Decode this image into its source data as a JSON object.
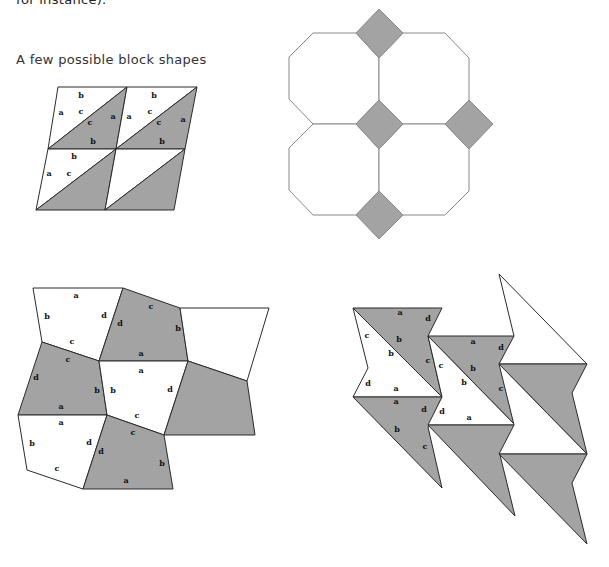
{
  "page": {
    "top_clipped_text": "for instance).",
    "heading": "A few possible block shapes"
  },
  "colors": {
    "fill_shaded": "#a3a3a3",
    "fill_light": "#ffffff",
    "stroke_dark": "#2a2a2a",
    "stroke_light": "#8a8a8a"
  },
  "figures": [
    {
      "name": "parallelogram-triangles",
      "description": "2x2 parallelogram blocks each split diagonally into white and shaded triangles",
      "labels": [
        {
          "t": "b",
          "x": 81,
          "y": 96
        },
        {
          "t": "a",
          "x": 61,
          "y": 113
        },
        {
          "t": "c",
          "x": 81,
          "y": 112
        },
        {
          "t": "c",
          "x": 90,
          "y": 123
        },
        {
          "t": "a",
          "x": 113,
          "y": 117
        },
        {
          "t": "b",
          "x": 93,
          "y": 142
        },
        {
          "t": "b",
          "x": 154,
          "y": 96
        },
        {
          "t": "a",
          "x": 129,
          "y": 117
        },
        {
          "t": "c",
          "x": 150,
          "y": 112
        },
        {
          "t": "c",
          "x": 159,
          "y": 123
        },
        {
          "t": "a",
          "x": 183,
          "y": 120
        },
        {
          "t": "b",
          "x": 162,
          "y": 142
        },
        {
          "t": "b",
          "x": 74,
          "y": 157
        },
        {
          "t": "a",
          "x": 49,
          "y": 174
        },
        {
          "t": "c",
          "x": 69,
          "y": 174
        }
      ]
    },
    {
      "name": "octagon-square",
      "description": "Four octagons with shaded square diamonds at the junctions",
      "labels": []
    },
    {
      "name": "quadrilateral-pentagons",
      "description": "Irregular quadrilaterals alternating white and shaded",
      "labels": [
        {
          "t": "a",
          "x": 76,
          "y": 296
        },
        {
          "t": "b",
          "x": 47,
          "y": 317
        },
        {
          "t": "d",
          "x": 104,
          "y": 316
        },
        {
          "t": "c",
          "x": 72,
          "y": 342
        },
        {
          "t": "c",
          "x": 151,
          "y": 307
        },
        {
          "t": "d",
          "x": 120,
          "y": 324
        },
        {
          "t": "b",
          "x": 178,
          "y": 329
        },
        {
          "t": "a",
          "x": 141,
          "y": 354
        },
        {
          "t": "c",
          "x": 68,
          "y": 360
        },
        {
          "t": "d",
          "x": 36,
          "y": 378
        },
        {
          "t": "b",
          "x": 97,
          "y": 391
        },
        {
          "t": "a",
          "x": 61,
          "y": 407
        },
        {
          "t": "a",
          "x": 141,
          "y": 371
        },
        {
          "t": "b",
          "x": 113,
          "y": 391
        },
        {
          "t": "d",
          "x": 170,
          "y": 390
        },
        {
          "t": "c",
          "x": 137,
          "y": 416
        },
        {
          "t": "a",
          "x": 61,
          "y": 423
        },
        {
          "t": "b",
          "x": 32,
          "y": 444
        },
        {
          "t": "d",
          "x": 89,
          "y": 443
        },
        {
          "t": "c",
          "x": 57,
          "y": 469
        },
        {
          "t": "c",
          "x": 133,
          "y": 433
        },
        {
          "t": "d",
          "x": 101,
          "y": 452
        },
        {
          "t": "b",
          "x": 162,
          "y": 464
        },
        {
          "t": "a",
          "x": 126,
          "y": 481
        }
      ]
    },
    {
      "name": "lightning-bolts",
      "description": "Notched triangles forming lightning-bolt tessellation",
      "labels": [
        {
          "t": "a",
          "x": 400,
          "y": 313
        },
        {
          "t": "d",
          "x": 428,
          "y": 319
        },
        {
          "t": "c",
          "x": 367,
          "y": 336
        },
        {
          "t": "b",
          "x": 399,
          "y": 340
        },
        {
          "t": "b",
          "x": 391,
          "y": 354
        },
        {
          "t": "c",
          "x": 428,
          "y": 361
        },
        {
          "t": "d",
          "x": 368,
          "y": 384
        },
        {
          "t": "a",
          "x": 396,
          "y": 389
        },
        {
          "t": "a",
          "x": 396,
          "y": 402
        },
        {
          "t": "d",
          "x": 424,
          "y": 410
        },
        {
          "t": "b",
          "x": 397,
          "y": 430
        },
        {
          "t": "c",
          "x": 425,
          "y": 447
        },
        {
          "t": "d",
          "x": 442,
          "y": 412
        },
        {
          "t": "a",
          "x": 473,
          "y": 342
        },
        {
          "t": "d",
          "x": 501,
          "y": 348
        },
        {
          "t": "c",
          "x": 441,
          "y": 366
        },
        {
          "t": "b",
          "x": 473,
          "y": 369
        },
        {
          "t": "b",
          "x": 464,
          "y": 383
        },
        {
          "t": "c",
          "x": 501,
          "y": 389
        },
        {
          "t": "a",
          "x": 469,
          "y": 418
        }
      ]
    }
  ]
}
